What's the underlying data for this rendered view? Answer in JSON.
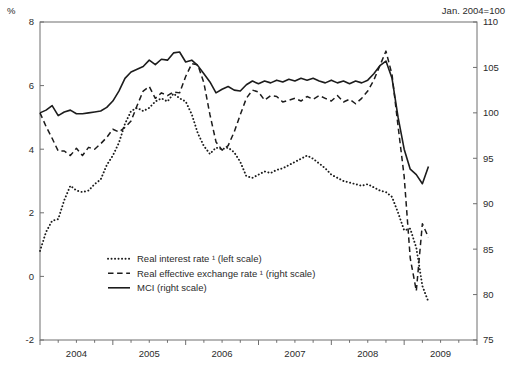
{
  "header": {
    "left_unit": "%",
    "right_note": "Jan. 2004=100"
  },
  "legend": {
    "items": [
      {
        "label": "Real interest rate ¹ (left scale)",
        "style": "dotted"
      },
      {
        "label": "Real effective exchange rate ¹ (right scale)",
        "style": "dashed"
      },
      {
        "label": "MCI (right scale)",
        "style": "solid"
      }
    ]
  },
  "chart_data": {
    "type": "line",
    "title": "",
    "xlabel": "",
    "ylabel": "%",
    "y2label": "Jan. 2004=100",
    "ylim": [
      -2,
      8
    ],
    "y2lim": [
      75,
      110
    ],
    "yticks": [
      8,
      6,
      4,
      2,
      0,
      -2
    ],
    "y2ticks": [
      110,
      105,
      100,
      95,
      90,
      85,
      80,
      75
    ],
    "xtick_labels": [
      "2004",
      "2005",
      "2006",
      "2007",
      "2008",
      "2009"
    ],
    "x_axis_start": "2004-01",
    "x_axis_end": "2010-01",
    "x_axis_months": 72,
    "x_minor_tick_months": 3,
    "data_start": "2004-01",
    "data_end": "2009-05",
    "grid": false,
    "legend_position": "lower-left",
    "line_color": "#1c1c1c",
    "axis_color": "#6f6f6f",
    "series": [
      {
        "name": "Real interest rate ¹ (left scale)",
        "short_name": "Real interest rate",
        "axis": "left",
        "style": "dotted",
        "unit": "%",
        "values": [
          0.8,
          1.4,
          1.75,
          1.8,
          2.4,
          2.85,
          2.7,
          2.65,
          2.7,
          2.9,
          3.05,
          3.5,
          3.8,
          4.2,
          4.8,
          5.2,
          5.3,
          5.2,
          5.3,
          5.5,
          5.6,
          5.5,
          5.75,
          5.6,
          5.5,
          5.1,
          4.5,
          4.1,
          3.85,
          4.05,
          4.0,
          4.05,
          3.9,
          3.6,
          3.15,
          3.1,
          3.2,
          3.3,
          3.25,
          3.35,
          3.4,
          3.5,
          3.6,
          3.7,
          3.8,
          3.7,
          3.55,
          3.4,
          3.2,
          3.1,
          3.0,
          2.95,
          2.9,
          2.85,
          2.9,
          2.8,
          2.7,
          2.65,
          2.5,
          2.0,
          1.45,
          1.5,
          0.9,
          -0.3,
          -0.8
        ]
      },
      {
        "name": "Real effective exchange rate ¹ (right scale)",
        "short_name": "Real effective exchange rate",
        "axis": "right",
        "style": "dashed",
        "unit": "index",
        "values": [
          100.0,
          98.5,
          97.2,
          95.8,
          95.8,
          95.3,
          96.1,
          95.3,
          96.2,
          96.0,
          96.6,
          97.3,
          98.2,
          97.9,
          98.4,
          99.1,
          100.8,
          102.4,
          102.9,
          101.6,
          102.2,
          101.9,
          102.3,
          102.2,
          104.0,
          105.4,
          105.3,
          103.3,
          99.8,
          96.8,
          95.9,
          96.4,
          97.9,
          99.8,
          101.6,
          102.5,
          102.3,
          101.4,
          101.9,
          101.8,
          101.2,
          101.4,
          101.6,
          101.3,
          101.8,
          101.5,
          101.9,
          101.6,
          101.3,
          101.9,
          101.2,
          101.5,
          101.0,
          101.6,
          102.4,
          103.6,
          105.2,
          106.8,
          104.2,
          98.5,
          93.0,
          84.0,
          80.4,
          87.8,
          86.3
        ]
      },
      {
        "name": "MCI (right scale)",
        "short_name": "MCI",
        "axis": "right",
        "style": "solid",
        "unit": "index",
        "values": [
          100.0,
          100.3,
          100.8,
          99.7,
          100.1,
          100.3,
          99.9,
          99.9,
          100.0,
          100.1,
          100.2,
          100.6,
          101.3,
          102.4,
          103.8,
          104.5,
          104.8,
          105.1,
          105.8,
          105.3,
          105.9,
          105.8,
          106.6,
          106.7,
          105.6,
          105.8,
          105.2,
          104.3,
          103.4,
          102.2,
          102.6,
          102.9,
          102.5,
          102.4,
          103.1,
          103.5,
          103.2,
          103.5,
          103.3,
          103.6,
          103.4,
          103.7,
          103.5,
          103.8,
          103.6,
          103.8,
          103.5,
          103.3,
          103.6,
          103.3,
          103.5,
          103.2,
          103.5,
          103.3,
          103.6,
          104.3,
          105.2,
          105.7,
          103.8,
          99.5,
          96.0,
          93.8,
          93.2,
          92.2,
          94.1
        ]
      }
    ]
  }
}
